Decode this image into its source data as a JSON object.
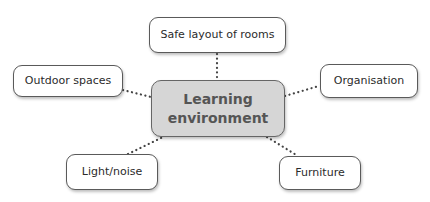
{
  "diagram": {
    "type": "mind-map",
    "center": {
      "label_line1": "Learning",
      "label_line2": "environment",
      "fill": "#d6d6d6",
      "text_color": "#555555"
    },
    "nodes": [
      {
        "id": "safe-layout",
        "label": "Safe layout of rooms"
      },
      {
        "id": "outdoor",
        "label": "Outdoor spaces"
      },
      {
        "id": "organisation",
        "label": "Organisation"
      },
      {
        "id": "light-noise",
        "label": "Light/noise"
      },
      {
        "id": "furniture",
        "label": "Furniture"
      }
    ],
    "connector_style": "dotted",
    "connector_color": "#444444"
  }
}
